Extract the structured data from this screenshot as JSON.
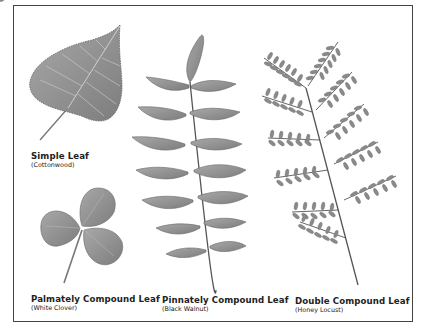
{
  "figure": {
    "panels": [
      {
        "id": "simple",
        "title": "Simple Leaf",
        "subtitle": "(Cottonwood)"
      },
      {
        "id": "palmate",
        "title": "Palmately Compound Leaf",
        "subtitle": "(White Clover)"
      },
      {
        "id": "pinnate",
        "title": "Pinnately Compound Leaf",
        "subtitle": "(Black Walnut)"
      },
      {
        "id": "double",
        "title": "Double Compound Leaf",
        "subtitle": "(Honey Locust)"
      }
    ],
    "colors": {
      "leaf": "#8f8f8f",
      "leaf_dark": "#6e6e6e",
      "vein": "#c9c9c9",
      "stem": "#555555",
      "border": "#444444",
      "text": "#222222"
    }
  }
}
